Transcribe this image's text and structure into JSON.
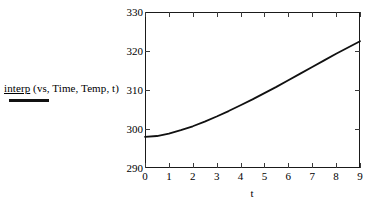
{
  "legend": {
    "series_name": "interp",
    "args": " (vs, Time, Temp, t)",
    "line_color": "#111111"
  },
  "chart_data": {
    "type": "line",
    "title": "",
    "xlabel": "t",
    "ylabel": "",
    "xlim": [
      0,
      9
    ],
    "ylim": [
      290,
      330
    ],
    "grid": false,
    "legend_position": "left",
    "xticks": [
      "0",
      "1",
      "2",
      "3",
      "4",
      "5",
      "6",
      "7",
      "8",
      "9"
    ],
    "yticks": [
      "290",
      "300",
      "310",
      "320",
      "330"
    ],
    "series": [
      {
        "name": "interp (vs, Time, Temp, t)",
        "color": "#111111",
        "x": [
          0,
          0.5,
          1,
          1.5,
          2,
          2.5,
          3,
          3.5,
          4,
          4.5,
          5,
          5.5,
          6,
          6.5,
          7,
          7.5,
          8,
          8.5,
          9
        ],
        "values": [
          298.0,
          298.2,
          298.8,
          299.7,
          300.7,
          301.9,
          303.2,
          304.6,
          306.1,
          307.6,
          309.2,
          310.8,
          312.5,
          314.2,
          315.9,
          317.6,
          319.3,
          320.9,
          322.5
        ]
      }
    ]
  }
}
